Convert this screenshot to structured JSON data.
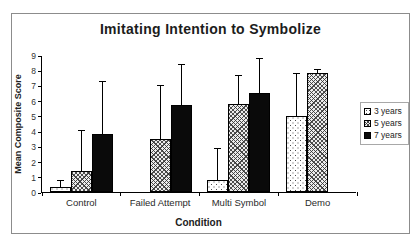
{
  "figure": {
    "title": "Imitating Intention to Symbolize",
    "background_color": "#ffffff",
    "frame_border_color": "#8c8c8c",
    "accent_black": "#0a0a0a"
  },
  "chart_data": {
    "type": "bar",
    "title": "Imitating Intention to Symbolize",
    "xlabel": "Condition",
    "ylabel": "Mean Composite Score",
    "ylim": [
      0,
      9
    ],
    "yticks": [
      0,
      1,
      2,
      3,
      4,
      5,
      6,
      7,
      8,
      9
    ],
    "grid": false,
    "legend_position": "right",
    "error_bars": "upper",
    "categories": [
      "Control",
      "Failed Attempt",
      "Multi Symbol",
      "Demo"
    ],
    "series": [
      {
        "name": "3 years",
        "pattern": "dots",
        "fill": "#ffffff",
        "values": [
          0.3,
          0,
          0.8,
          5.0
        ],
        "error_upper": [
          0.5,
          0,
          2.1,
          2.8
        ]
      },
      {
        "name": "5 years",
        "pattern": "crosshatch",
        "fill": "#d9d9d9",
        "values": [
          1.4,
          3.5,
          5.8,
          7.8
        ],
        "error_upper": [
          2.7,
          3.5,
          1.9,
          0.3
        ]
      },
      {
        "name": "7 years",
        "pattern": "solid",
        "fill": "#000000",
        "values": [
          3.8,
          5.7,
          6.5,
          0
        ],
        "error_upper": [
          3.5,
          2.7,
          2.3,
          0
        ]
      }
    ]
  }
}
